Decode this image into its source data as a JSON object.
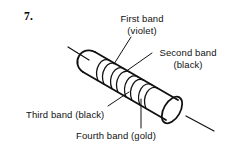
{
  "figure": {
    "item_number": "7.",
    "line_color": "#111111",
    "background_color": "#ffffff",
    "labels": {
      "first_band": {
        "name": "First band",
        "value": "(violet)"
      },
      "second_band": {
        "name": "Second band",
        "value": "(black)"
      },
      "third_band": {
        "name": "Third band (black)"
      },
      "fourth_band": {
        "name": "Fourth band (gold)"
      }
    }
  }
}
